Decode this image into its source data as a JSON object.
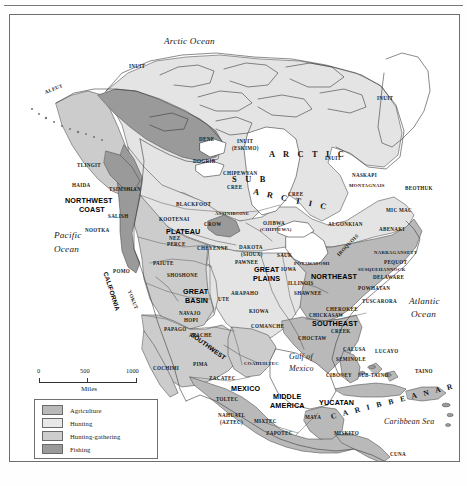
{
  "map": {
    "title": "Native American Culture Areas of North America",
    "width": 467,
    "height": 486
  },
  "water_labels": [
    {
      "text": "Arctic Ocean",
      "x": 163,
      "y": 36,
      "size": "lg"
    },
    {
      "text": "Pacific",
      "x": 53,
      "y": 230,
      "size": "lg"
    },
    {
      "text": "Ocean",
      "x": 53,
      "y": 244,
      "size": "lg"
    },
    {
      "text": "Atlantic",
      "x": 408,
      "y": 296,
      "size": "lg"
    },
    {
      "text": "Ocean",
      "x": 410,
      "y": 309,
      "size": "lg"
    },
    {
      "text": "Gulf of",
      "x": 288,
      "y": 352,
      "size": "sm"
    },
    {
      "text": "Mexico",
      "x": 288,
      "y": 364,
      "size": "sm"
    },
    {
      "text": "Caribbean Sea",
      "x": 383,
      "y": 417,
      "size": "sm"
    }
  ],
  "culture_areas": [
    {
      "text": "NORTHWEST",
      "x": 64,
      "y": 196
    },
    {
      "text": "COAST",
      "x": 78,
      "y": 205
    },
    {
      "text": "PLATEAU",
      "x": 165,
      "y": 227
    },
    {
      "text": "GREAT",
      "x": 182,
      "y": 287
    },
    {
      "text": "BASIN",
      "x": 184,
      "y": 296
    },
    {
      "text": "GREAT",
      "x": 253,
      "y": 265
    },
    {
      "text": "PLAINS",
      "x": 252,
      "y": 274
    },
    {
      "text": "NORTHEAST",
      "x": 310,
      "y": 272
    },
    {
      "text": "SOUTHEAST",
      "x": 311,
      "y": 319
    },
    {
      "text": "MEXICO",
      "x": 230,
      "y": 384
    },
    {
      "text": "MIDDLE",
      "x": 272,
      "y": 392
    },
    {
      "text": "AMERICA",
      "x": 269,
      "y": 401
    },
    {
      "text": "YUCATAN",
      "x": 318,
      "y": 398
    }
  ],
  "rotated_areas": [
    {
      "text": "CALIFORNIA",
      "x": 104,
      "y": 268,
      "rotate": 72
    },
    {
      "text": "SOUTHWEST",
      "x": 190,
      "y": 330,
      "rotate": 36
    }
  ],
  "spaced_regions": [
    {
      "text": "A R C T I C",
      "x": 268,
      "y": 150,
      "rotate": 0,
      "size": "lg"
    },
    {
      "text": "S U B",
      "x": 231,
      "y": 175,
      "rotate": 0,
      "size": "lg"
    },
    {
      "text": "A R C T I C",
      "x": 252,
      "y": 187,
      "rotate": 12,
      "size": "lg"
    },
    {
      "text": "C A R I B B E A N   A R E A",
      "x": 330,
      "y": 412,
      "rotate": -14,
      "size": "sm"
    }
  ],
  "tribes": [
    {
      "text": "INUIT",
      "x": 128,
      "y": 63
    },
    {
      "text": "ALEUT",
      "x": 44,
      "y": 89,
      "rotate": -22
    },
    {
      "text": "TLINGIT",
      "x": 76,
      "y": 162
    },
    {
      "text": "HAIDA",
      "x": 71,
      "y": 182
    },
    {
      "text": "TSIMSHIAN",
      "x": 108,
      "y": 186
    },
    {
      "text": "SALISH",
      "x": 107,
      "y": 213
    },
    {
      "text": "NOOTKA",
      "x": 84,
      "y": 227
    },
    {
      "text": "DENE",
      "x": 198,
      "y": 136
    },
    {
      "text": "DOGRIB",
      "x": 192,
      "y": 158
    },
    {
      "text": "INUIT",
      "x": 236,
      "y": 138
    },
    {
      "text": "(ESKIMO)",
      "x": 231,
      "y": 145
    },
    {
      "text": "INUIT",
      "x": 376,
      "y": 95
    },
    {
      "text": "INUIT",
      "x": 324,
      "y": 155
    },
    {
      "text": "CHIPEWYAN",
      "x": 222,
      "y": 170
    },
    {
      "text": "CREE",
      "x": 226,
      "y": 184
    },
    {
      "text": "CREE",
      "x": 287,
      "y": 191
    },
    {
      "text": "NASKAPI",
      "x": 351,
      "y": 172
    },
    {
      "text": "MONTAGNAIS",
      "x": 348,
      "y": 183
    },
    {
      "text": "BEOTHUK",
      "x": 404,
      "y": 185
    },
    {
      "text": "MIC MAC",
      "x": 385,
      "y": 207
    },
    {
      "text": "ABENAKI",
      "x": 378,
      "y": 226
    },
    {
      "text": "ALGONKIAN",
      "x": 327,
      "y": 221
    },
    {
      "text": "OJIBWA",
      "x": 262,
      "y": 220
    },
    {
      "text": "(CHIPPEWA)",
      "x": 259,
      "y": 227
    },
    {
      "text": "BLACKFOOT",
      "x": 175,
      "y": 201
    },
    {
      "text": "ASSINIBOINE",
      "x": 214,
      "y": 211
    },
    {
      "text": "KOOTENAI",
      "x": 158,
      "y": 216
    },
    {
      "text": "CROW",
      "x": 203,
      "y": 221
    },
    {
      "text": "NEZ",
      "x": 168,
      "y": 235
    },
    {
      "text": "PERCE",
      "x": 166,
      "y": 241
    },
    {
      "text": "CHEYENNE",
      "x": 196,
      "y": 245
    },
    {
      "text": "DAKOTA",
      "x": 238,
      "y": 244
    },
    {
      "text": "(SIOUX)",
      "x": 240,
      "y": 251
    },
    {
      "text": "PAWNEE",
      "x": 234,
      "y": 259
    },
    {
      "text": "SAUK",
      "x": 276,
      "y": 252
    },
    {
      "text": "IOWA",
      "x": 280,
      "y": 266
    },
    {
      "text": "ILLINOIS",
      "x": 287,
      "y": 280
    },
    {
      "text": "SHAWNEE",
      "x": 293,
      "y": 290
    },
    {
      "text": "POTAWATOMI",
      "x": 293,
      "y": 261
    },
    {
      "text": "IROQUOIS",
      "x": 337,
      "y": 252,
      "rotate": -46
    },
    {
      "text": "NARRAGANSETT",
      "x": 373,
      "y": 250
    },
    {
      "text": "PEQUOT",
      "x": 383,
      "y": 259
    },
    {
      "text": "SUSQUEHANNOCK",
      "x": 357,
      "y": 267
    },
    {
      "text": "DELAWARE",
      "x": 372,
      "y": 274
    },
    {
      "text": "POWHATAN",
      "x": 357,
      "y": 285
    },
    {
      "text": "TUSCARORA",
      "x": 361,
      "y": 298
    },
    {
      "text": "CHEROKEE",
      "x": 325,
      "y": 306
    },
    {
      "text": "CHICKASAW",
      "x": 308,
      "y": 312
    },
    {
      "text": "CREEK",
      "x": 330,
      "y": 328
    },
    {
      "text": "CHOCTAW",
      "x": 297,
      "y": 335
    },
    {
      "text": "PAIUTE",
      "x": 152,
      "y": 260
    },
    {
      "text": "SHOSHONE",
      "x": 166,
      "y": 272
    },
    {
      "text": "POMO",
      "x": 112,
      "y": 268
    },
    {
      "text": "YOKUT",
      "x": 128,
      "y": 287,
      "rotate": 68
    },
    {
      "text": "UTE",
      "x": 217,
      "y": 296
    },
    {
      "text": "ARAPAHO",
      "x": 230,
      "y": 290
    },
    {
      "text": "KIOWA",
      "x": 248,
      "y": 308
    },
    {
      "text": "COMANCHE",
      "x": 250,
      "y": 323
    },
    {
      "text": "NAVAJO",
      "x": 178,
      "y": 310
    },
    {
      "text": "HOPI",
      "x": 183,
      "y": 317
    },
    {
      "text": "PAPAGO",
      "x": 163,
      "y": 326
    },
    {
      "text": "APACHE",
      "x": 188,
      "y": 332
    },
    {
      "text": "COAHUILTEC",
      "x": 243,
      "y": 361
    },
    {
      "text": "COCHIMI",
      "x": 152,
      "y": 365
    },
    {
      "text": "PIMA",
      "x": 192,
      "y": 361
    },
    {
      "text": "ZACATEC",
      "x": 208,
      "y": 375
    },
    {
      "text": "TOLTEC",
      "x": 215,
      "y": 396
    },
    {
      "text": "NAHUATL",
      "x": 217,
      "y": 412
    },
    {
      "text": "(AZTEC)",
      "x": 219,
      "y": 419
    },
    {
      "text": "MIXTEC",
      "x": 253,
      "y": 418
    },
    {
      "text": "ZAPOTEC",
      "x": 265,
      "y": 430
    },
    {
      "text": "MAYA",
      "x": 304,
      "y": 414
    },
    {
      "text": "MISKITO",
      "x": 333,
      "y": 430
    },
    {
      "text": "CUNA",
      "x": 389,
      "y": 451
    },
    {
      "text": "GUAYMI",
      "x": 365,
      "y": 468
    },
    {
      "text": "CALUSA",
      "x": 342,
      "y": 346
    },
    {
      "text": "SEMINOLE",
      "x": 335,
      "y": 356
    },
    {
      "text": "LUCAYO",
      "x": 374,
      "y": 348
    },
    {
      "text": "CIBONEY",
      "x": 325,
      "y": 372
    },
    {
      "text": "SUB-TAINO",
      "x": 357,
      "y": 372
    },
    {
      "text": "TAINO",
      "x": 414,
      "y": 368
    }
  ],
  "scale": {
    "ticks": [
      "0",
      "500",
      "1000"
    ],
    "unit": "Miles"
  },
  "legend": {
    "items": [
      {
        "label": "Agriculture",
        "color": "#b9b9b9"
      },
      {
        "label": "Hunting",
        "color": "#e8e8e8"
      },
      {
        "label": "Hunting-gathering",
        "color": "#cdcdcd"
      },
      {
        "label": "Fishing",
        "color": "#9a9a9a"
      }
    ]
  },
  "palette": {
    "agriculture": "#b9b9b9",
    "hunting": "#e4e4e4",
    "hunting_gathering": "#cccccc",
    "fishing": "#9a9a9a",
    "water": "#ffffff",
    "coastline": "#4a4a4a",
    "border": "#6f6f6f"
  }
}
